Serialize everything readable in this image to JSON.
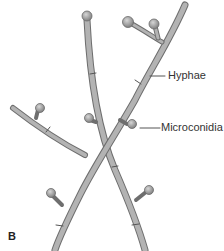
{
  "figure": {
    "panel_letter": "B",
    "labels": {
      "hyphae": "Hyphae",
      "microconidia": "Microconidia"
    },
    "colors": {
      "hypha_fill": "#a9a9a9",
      "hypha_edge": "#6e6e6e",
      "conidium_fill": "#9c9c9c",
      "leader_line": "#555555",
      "text": "#333333"
    }
  }
}
